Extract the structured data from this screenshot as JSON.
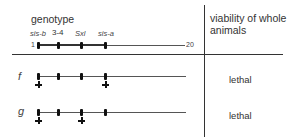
{
  "header": {
    "genotype_label": "genotype",
    "viability_label_line1": "viability of whole",
    "viability_label_line2": "animals"
  },
  "chromosome": {
    "start_label": "1",
    "end_label": "20",
    "loci": [
      {
        "name": "sis-b",
        "italic": true
      },
      {
        "name": "3-4",
        "italic": false
      },
      {
        "name": "Sxl",
        "italic": true
      },
      {
        "name": "sis-a",
        "italic": true
      }
    ]
  },
  "rows": [
    {
      "label": "f",
      "mutant_loci": [
        "sis-b",
        "sis-a"
      ],
      "viability": "lethal"
    },
    {
      "label": "g",
      "mutant_loci": [
        "sis-b",
        "Sxl"
      ],
      "viability": "lethal"
    }
  ]
}
